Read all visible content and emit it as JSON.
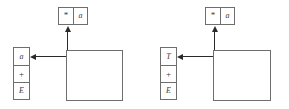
{
  "figure": {
    "background_color": "#ffffff",
    "line_color": "#6e6e6e",
    "arrow_color": "#2a2a2a",
    "text_color": "#3a3a3a"
  },
  "panels": [
    {
      "id": "left",
      "input_buffer": {
        "cells": [
          {
            "label": "*",
            "kind": "symbol"
          },
          {
            "label": "a",
            "kind": "terminal"
          }
        ]
      },
      "stack": {
        "cells": [
          {
            "label": "a",
            "kind": "terminal"
          },
          {
            "label": "+",
            "kind": "operator"
          },
          {
            "label": "E",
            "kind": "nonterminal"
          }
        ]
      },
      "parser_box": {
        "label": ""
      },
      "arrows": [
        {
          "name": "input-arrow",
          "direction": "up"
        },
        {
          "name": "stack-arrow",
          "direction": "left"
        }
      ]
    },
    {
      "id": "right",
      "input_buffer": {
        "cells": [
          {
            "label": "*",
            "kind": "symbol"
          },
          {
            "label": "a",
            "kind": "terminal"
          }
        ]
      },
      "stack": {
        "cells": [
          {
            "label": "T",
            "kind": "nonterminal"
          },
          {
            "label": "+",
            "kind": "operator"
          },
          {
            "label": "E",
            "kind": "nonterminal"
          }
        ]
      },
      "parser_box": {
        "label": ""
      },
      "arrows": [
        {
          "name": "input-arrow",
          "direction": "up"
        },
        {
          "name": "stack-arrow",
          "direction": "left"
        }
      ]
    }
  ]
}
